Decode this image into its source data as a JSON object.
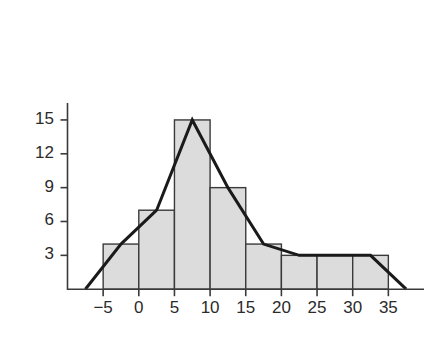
{
  "chart_data": {
    "type": "bar",
    "title": "",
    "subtitle": "",
    "xlabel": "",
    "ylabel": "",
    "categories": [
      "-5 to 0",
      "0 to 5",
      "5 to 10",
      "10 to 15",
      "15 to 20",
      "20 to 25",
      "25 to 30",
      "30 to 35"
    ],
    "bin_edges": [
      -5,
      0,
      5,
      10,
      15,
      20,
      25,
      30,
      35
    ],
    "bin_midpoints": [
      -2.5,
      2.5,
      7.5,
      12.5,
      17.5,
      22.5,
      27.5,
      32.5
    ],
    "values": [
      4,
      7,
      15,
      9,
      4,
      3,
      3,
      3
    ],
    "series": [
      {
        "name": "Frequency (histogram bars)",
        "values": [
          4,
          7,
          15,
          9,
          4,
          3,
          3,
          3
        ]
      },
      {
        "name": "Frequency polygon",
        "x": [
          -7.5,
          -2.5,
          2.5,
          7.5,
          12.5,
          17.5,
          22.5,
          27.5,
          32.5,
          37.5
        ],
        "values": [
          0,
          4,
          7,
          15,
          9,
          4,
          3,
          3,
          3,
          0
        ]
      }
    ],
    "xlim": [
      -10,
      40
    ],
    "ylim": [
      0,
      16.5
    ],
    "xticks": [
      -5,
      0,
      5,
      10,
      15,
      20,
      25,
      30,
      35
    ],
    "xtick_labels": [
      "−5",
      "0",
      "5",
      "10",
      "15",
      "20",
      "25",
      "30",
      "35"
    ],
    "yticks": [
      3,
      6,
      9,
      12,
      15
    ],
    "ytick_labels": [
      "3",
      "6",
      "9",
      "12",
      "15"
    ],
    "grid": false,
    "legend": "none",
    "colors": {
      "bar_fill": "#dcdcdc",
      "bar_stroke": "#3a3a3a",
      "polygon_line": "#1a1a1a",
      "axis": "#3a3a3a",
      "tick_text": "#2b2b2b",
      "background": "#ffffff"
    }
  }
}
